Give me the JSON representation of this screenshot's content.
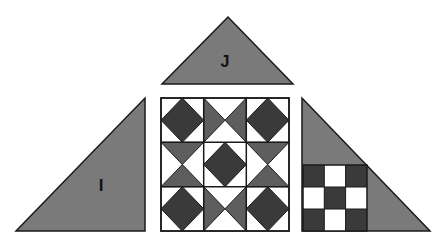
{
  "figure": {
    "colors": {
      "background": "#ffffff",
      "triangle_fill": "#7a7a7a",
      "dark_fill": "#3a3a3a",
      "mid_fill": "#5e5e5e",
      "light_fill": "#ffffff",
      "stroke": "#1a1a1a"
    },
    "pieces": {
      "top_triangle": {
        "label": "J"
      },
      "left_triangle": {
        "label": "I"
      },
      "right_triangle": {
        "label": "",
        "inset": "3x3 checkerboard"
      },
      "center_square": {
        "grid": "3x3",
        "pattern": [
          "diamond",
          "hourglass-horizontal",
          "diamond",
          "hourglass-vertical",
          "diamond",
          "hourglass-vertical",
          "diamond",
          "hourglass-horizontal",
          "diamond"
        ]
      }
    },
    "checkerboard": [
      [
        1,
        0,
        1
      ],
      [
        0,
        1,
        0
      ],
      [
        1,
        0,
        1
      ]
    ]
  }
}
